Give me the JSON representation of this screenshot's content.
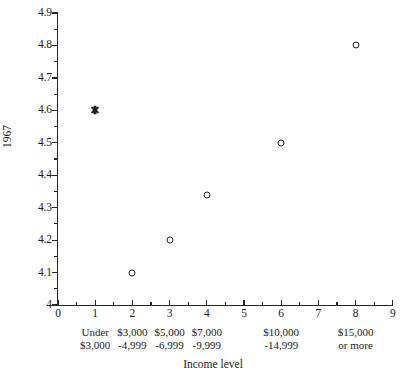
{
  "chart_data": {
    "type": "scatter",
    "title": "",
    "xlabel": "Income level",
    "ylabel": "1967",
    "xlim": [
      0,
      9
    ],
    "ylim": [
      4.0,
      4.9
    ],
    "grid": false,
    "legend": "none",
    "x": [
      1,
      2,
      3,
      4,
      6,
      8
    ],
    "values": [
      4.6,
      4.1,
      4.2,
      4.34,
      4.5,
      4.8
    ],
    "points": [
      {
        "x": 1,
        "y": 4.6,
        "marker": "filled-star"
      },
      {
        "x": 2,
        "y": 4.1,
        "marker": "open-circle"
      },
      {
        "x": 3,
        "y": 4.2,
        "marker": "open-circle"
      },
      {
        "x": 4,
        "y": 4.34,
        "marker": "open-circle"
      },
      {
        "x": 6,
        "y": 4.5,
        "marker": "open-circle"
      },
      {
        "x": 8,
        "y": 4.8,
        "marker": "open-circle"
      }
    ],
    "y_tick_labels": [
      "4",
      "4.1",
      "4.2",
      "4.3",
      "4.4",
      "4.5",
      "4.6",
      "4.7",
      "4.8",
      "4.9"
    ],
    "y_tick_values": [
      4.0,
      4.1,
      4.2,
      4.3,
      4.4,
      4.5,
      4.6,
      4.7,
      4.8,
      4.9
    ],
    "x_tick_labels": [
      "0",
      "1",
      "2",
      "3",
      "4",
      "5",
      "6",
      "7",
      "8",
      "9"
    ],
    "x_tick_values": [
      0,
      1,
      2,
      3,
      4,
      5,
      6,
      7,
      8,
      9
    ],
    "x_category_labels": [
      {
        "x": 1,
        "line1": "Under",
        "line2": "$3,000"
      },
      {
        "x": 2,
        "line1": "$3,000",
        "line2": "-4,999"
      },
      {
        "x": 3,
        "line1": "$5,000",
        "line2": "-6,999"
      },
      {
        "x": 4,
        "line1": "$7,000",
        "line2": "-9,999"
      },
      {
        "x": 6,
        "line1": "$10,000",
        "line2": "-14,999"
      },
      {
        "x": 8,
        "line1": "$15,000",
        "line2": "or more"
      }
    ],
    "colors": {
      "background": "#ffffff",
      "axis": "#262626",
      "marker": "#1d1d1d",
      "text": "#1a1a1a"
    }
  }
}
